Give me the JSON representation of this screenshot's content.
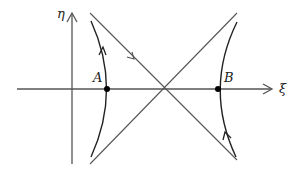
{
  "diagram": {
    "type": "phase-portrait",
    "axes": {
      "horizontal_label": "ξ",
      "vertical_label": "η"
    },
    "points": [
      {
        "label": "A"
      },
      {
        "label": "B"
      }
    ],
    "elements": [
      "two crossing separatrix lines through the origin-like saddle point on the ξ axis",
      "left hyperbolic trajectory through A, arrow pointing upward",
      "right hyperbolic trajectory through B, arrow pointing upward",
      "arrow on descending diagonal pointing toward the crossing"
    ],
    "colors": {
      "axis": "#555555",
      "curve": "#222222",
      "line": "#555555",
      "point": "#000000"
    }
  }
}
